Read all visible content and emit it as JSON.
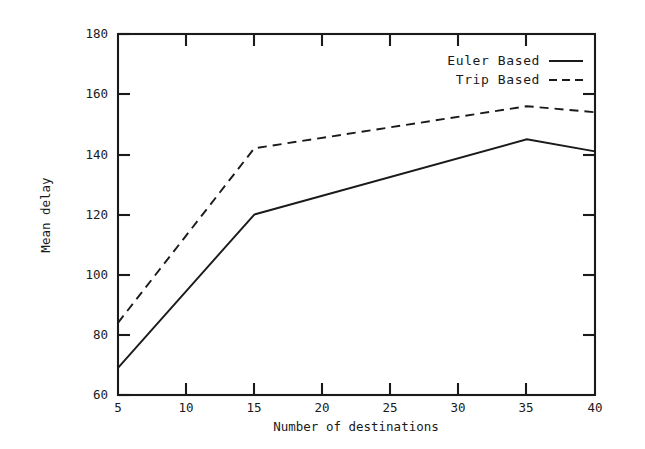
{
  "chart_data": {
    "type": "line",
    "title": "",
    "xlabel": "Number of destinations",
    "ylabel": "Mean delay",
    "xlim": [
      5,
      40
    ],
    "ylim": [
      60,
      180
    ],
    "xticks": [
      5,
      10,
      15,
      20,
      25,
      30,
      35,
      40
    ],
    "yticks": [
      60,
      80,
      100,
      120,
      140,
      160,
      180
    ],
    "xtick_labels": [
      "5",
      "10",
      "15",
      "20",
      "25",
      "30",
      "35",
      "40"
    ],
    "ytick_labels": [
      "60",
      "80",
      "100",
      "120",
      "140",
      "160",
      "180"
    ],
    "grid": false,
    "legend_position": "top-right-inside",
    "x": [
      5,
      15,
      35,
      40
    ],
    "series": [
      {
        "name": "Euler Based",
        "style": "solid",
        "color": "#1a1a1a",
        "values": [
          69,
          120,
          145,
          141
        ]
      },
      {
        "name": "Trip Based",
        "style": "dashed",
        "color": "#1a1a1a",
        "values": [
          84,
          142,
          156,
          154
        ]
      }
    ],
    "legend": [
      {
        "label": "Euler Based",
        "style": "solid"
      },
      {
        "label": "Trip Based",
        "style": "dashed"
      }
    ]
  }
}
